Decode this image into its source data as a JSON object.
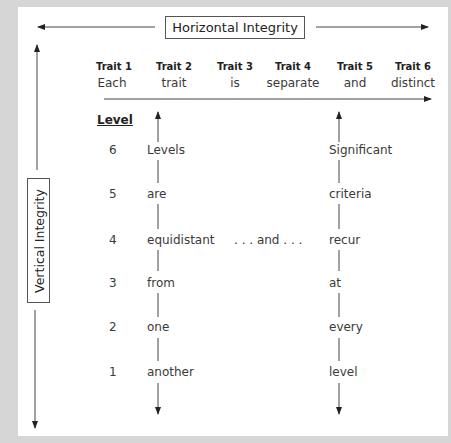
{
  "diagram": {
    "horizontal_label": "Horizontal Integrity",
    "vertical_label": "Vertical Integrity",
    "traits": [
      {
        "header": "Trait 1",
        "word": "Each"
      },
      {
        "header": "Trait 2",
        "word": "trait"
      },
      {
        "header": "Trait 3",
        "word": "is"
      },
      {
        "header": "Trait 4",
        "word": "separate"
      },
      {
        "header": "Trait 5",
        "word": "and"
      },
      {
        "header": "Trait 6",
        "word": "distinct"
      }
    ],
    "level_heading": "Level",
    "levels": [
      {
        "number": "6",
        "left_word": "Levels",
        "right_word": "Significant"
      },
      {
        "number": "5",
        "left_word": "are",
        "right_word": "criteria"
      },
      {
        "number": "4",
        "left_word": "equidistant",
        "right_word": "recur",
        "middle": ". . . and . . ."
      },
      {
        "number": "3",
        "left_word": "from",
        "right_word": "at"
      },
      {
        "number": "2",
        "left_word": "one",
        "right_word": "every"
      },
      {
        "number": "1",
        "left_word": "another",
        "right_word": "level"
      }
    ],
    "colors": {
      "background": "#d6d6d6",
      "panel": "#ffffff",
      "line": "#333333",
      "text": "#3a3a3a"
    }
  }
}
